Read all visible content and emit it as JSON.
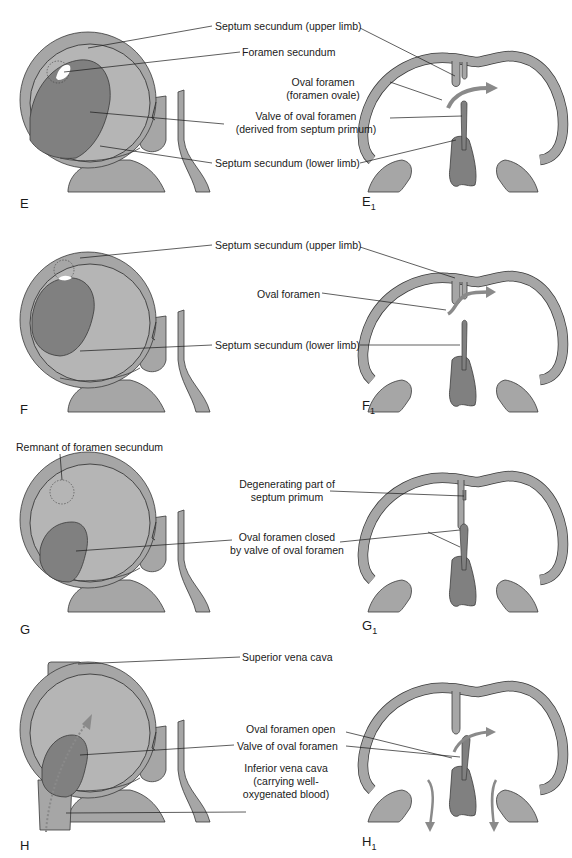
{
  "colors": {
    "wall": "#a6a6a6",
    "inner": "#b5b5b5",
    "valve": "#808080",
    "septum_dark": "#7a7a7a",
    "outline": "#3a3a3a",
    "arrow": "#8a8a8a",
    "background": "#ffffff"
  },
  "panels": [
    {
      "id": "E",
      "left_label": "E",
      "right_label": "E",
      "right_sub": "1",
      "labels": [
        "Septum secundum (upper limb)",
        "Foramen secundum",
        "Oval foramen",
        "(foramen ovale)",
        "Valve of oval foramen",
        "(derived from septum primum)",
        "Septum secundum (lower limb)"
      ]
    },
    {
      "id": "F",
      "left_label": "F",
      "right_label": "F",
      "right_sub": "1",
      "labels": [
        "Septum secundum (upper limb)",
        "Oval foramen",
        "Septum secundum (lower limb)"
      ]
    },
    {
      "id": "G",
      "left_label": "G",
      "right_label": "G",
      "right_sub": "1",
      "labels": [
        "Remnant of foramen secundum",
        "Degenerating part of",
        "septum primum",
        "Oval foramen closed",
        "by valve of oval foramen"
      ]
    },
    {
      "id": "H",
      "left_label": "H",
      "right_label": "H",
      "right_sub": "1",
      "labels": [
        "Superior vena cava",
        "Oval foramen open",
        "Valve of oval foramen",
        "Inferior vena cava",
        "(carrying well-",
        "oxygenated blood)"
      ]
    }
  ]
}
